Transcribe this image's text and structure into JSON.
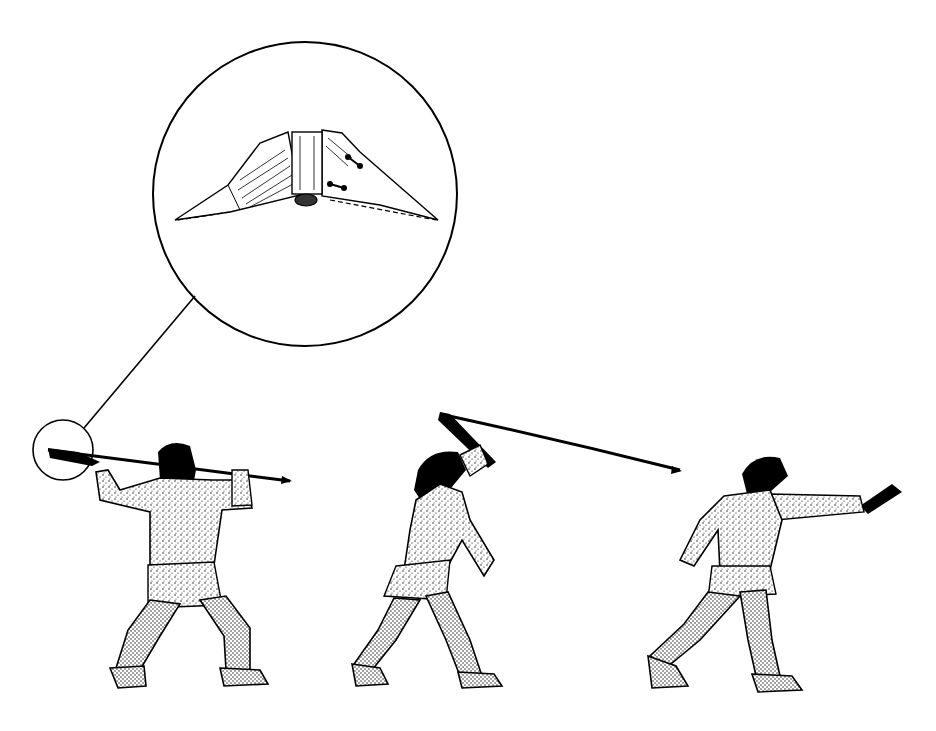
{
  "illustration": {
    "description": "Atlatl (spear-thrower) throwing sequence with magnified detail of the spear-thrower hook/weight",
    "colors": {
      "ink": "#000000",
      "paper": "#ffffff",
      "shade": "#e8e8e8"
    },
    "magnifier": {
      "cx": 305,
      "cy": 194,
      "r": 152,
      "detail_cx": 63,
      "detail_cy": 450,
      "detail_r": 30
    },
    "figures": [
      {
        "id": "figure-1",
        "pose": "wind-up, crouched, spear held back over shoulder"
      },
      {
        "id": "figure-2",
        "pose": "mid-throw, atlatl swung overhead, spear flexing"
      },
      {
        "id": "figure-3",
        "pose": "follow-through, arm extended forward"
      }
    ]
  }
}
